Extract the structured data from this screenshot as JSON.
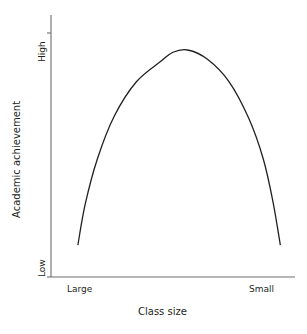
{
  "chart_data": {
    "type": "line",
    "title": "",
    "subtitle": "",
    "xlabel": "Class size",
    "ylabel": "Academic achievement",
    "x_tick_labels": [
      "Large",
      "Small"
    ],
    "y_tick_labels": [
      "Low",
      "High"
    ],
    "grid": false,
    "legend": null,
    "annotations": [],
    "axis_color": "#6d6e71",
    "curve_color": "#231f20",
    "text_color": "#231f20",
    "xlim": [
      0,
      1
    ],
    "ylim": [
      0,
      1
    ],
    "series": [
      {
        "name": "Academic achievement vs class size",
        "shape": "inverted-u",
        "comment": "Low at large classes, rises to a peak at moderate class size, falls again at small classes",
        "points": [
          {
            "x": 0.11,
            "y": 0.14
          },
          {
            "x": 0.14,
            "y": 0.32
          },
          {
            "x": 0.19,
            "y": 0.52
          },
          {
            "x": 0.26,
            "y": 0.71
          },
          {
            "x": 0.35,
            "y": 0.86
          },
          {
            "x": 0.45,
            "y": 0.95
          },
          {
            "x": 0.5,
            "y": 0.99
          },
          {
            "x": 0.56,
            "y": 1.0
          },
          {
            "x": 0.64,
            "y": 0.96
          },
          {
            "x": 0.73,
            "y": 0.86
          },
          {
            "x": 0.81,
            "y": 0.7
          },
          {
            "x": 0.87,
            "y": 0.52
          },
          {
            "x": 0.91,
            "y": 0.33
          },
          {
            "x": 0.94,
            "y": 0.14
          }
        ]
      }
    ]
  },
  "axes": {
    "y_axis_name": "vertical-axis-line",
    "x_axis_name": "horizontal-axis-line"
  }
}
